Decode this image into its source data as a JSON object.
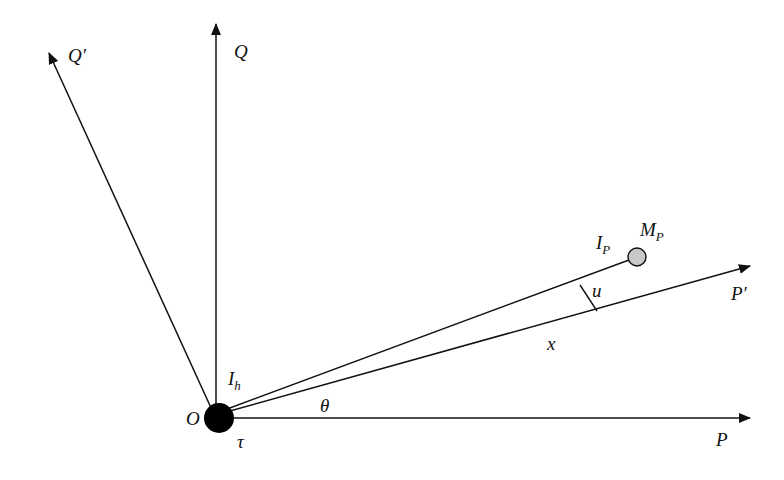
{
  "diagram": {
    "origin_label": "O",
    "axes": [
      {
        "id": "P",
        "label": "P"
      },
      {
        "id": "Q",
        "label": "Q"
      },
      {
        "id": "P_prime",
        "label": "P′"
      },
      {
        "id": "Q_prime",
        "label": "Q′"
      }
    ],
    "labels": {
      "I_h_main": "I",
      "I_h_sub": "h",
      "I_P_main": "I",
      "I_P_sub": "P",
      "M_P_main": "M",
      "M_P_sub": "P",
      "u": "u",
      "x": "x",
      "theta": "θ",
      "tau": "τ"
    },
    "colors": {
      "line": "#111111",
      "origin_fill": "#000000",
      "mass_fill": "#c8c8c8"
    }
  }
}
